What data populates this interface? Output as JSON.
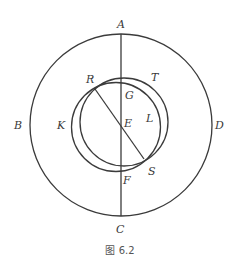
{
  "figure": {
    "caption": "图 6.2",
    "colors": {
      "line": "#3b3b3b",
      "label": "#3a3a3a",
      "caption": "#555555",
      "background": "#ffffff"
    },
    "outer_circle": {
      "cx": 121,
      "cy": 125,
      "r": 91
    },
    "circle_T": {
      "cx": 124,
      "cy": 122,
      "r": 44
    },
    "circle_K": {
      "cx": 116,
      "cy": 127,
      "r": 44.5
    },
    "vertical_line": {
      "x": 121,
      "y1": 34,
      "y2": 216
    },
    "diagonal_line": {
      "x1": 95,
      "y1": 89,
      "x2": 144,
      "y2": 159
    },
    "labels": {
      "A": {
        "text": "A",
        "x": 121,
        "y": 28
      },
      "B": {
        "text": "B",
        "x": 18,
        "y": 129
      },
      "C": {
        "text": "C",
        "x": 120,
        "y": 233
      },
      "D": {
        "text": "D",
        "x": 219,
        "y": 129
      },
      "R": {
        "text": "R",
        "x": 90,
        "y": 83
      },
      "T": {
        "text": "T",
        "x": 155,
        "y": 81
      },
      "G": {
        "text": "G",
        "x": 129,
        "y": 99
      },
      "K": {
        "text": "K",
        "x": 62,
        "y": 129
      },
      "E": {
        "text": "E",
        "x": 128,
        "y": 127
      },
      "L": {
        "text": "L",
        "x": 149,
        "y": 122
      },
      "F": {
        "text": "F",
        "x": 127,
        "y": 184
      },
      "S": {
        "text": "S",
        "x": 152,
        "y": 175
      }
    }
  }
}
